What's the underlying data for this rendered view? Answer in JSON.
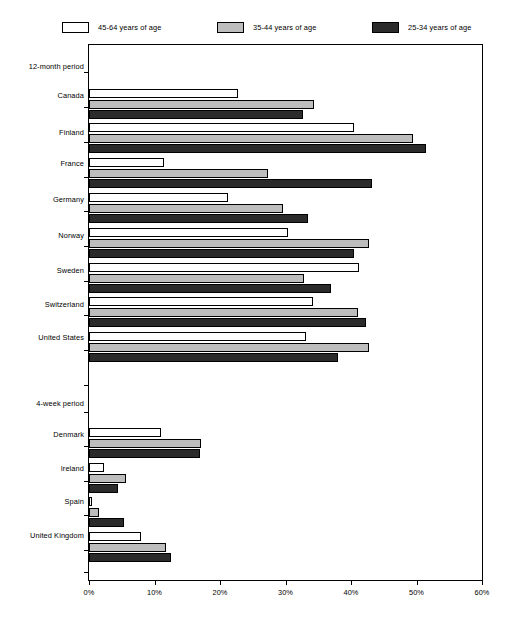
{
  "legend": {
    "items": [
      {
        "label": "45-64 years of age",
        "swatch": "white",
        "color": "#ffffff"
      },
      {
        "label": "35-44 years of age",
        "swatch": "gray",
        "color": "#bdbdbd"
      },
      {
        "label": "25-34 years of age",
        "swatch": "dark",
        "color": "#2b2b2b"
      }
    ]
  },
  "axis": {
    "ticks": [
      "0%",
      "10%",
      "20%",
      "30%",
      "40%",
      "50%",
      "60%"
    ],
    "min": 0,
    "max": 60
  },
  "sections": [
    {
      "label": "12-month period"
    },
    {
      "label": "4-week period"
    }
  ],
  "chart_data": {
    "type": "bar",
    "orientation": "horizontal",
    "title": "",
    "xlabel": "",
    "ylabel": "",
    "xlim": [
      0,
      60
    ],
    "xticks": [
      0,
      10,
      20,
      30,
      40,
      50,
      60
    ],
    "xtick_labels": [
      "0%",
      "10%",
      "20%",
      "30%",
      "40%",
      "50%",
      "60%"
    ],
    "grid": false,
    "legend_position": "top",
    "group_labels": [
      "12-month period",
      "4-week period"
    ],
    "groups": [
      {
        "name": "12-month period",
        "categories": [
          "Canada",
          "Finland",
          "France",
          "Germany",
          "Norway",
          "Sweden",
          "Switzerland",
          "United States"
        ]
      },
      {
        "name": "4-week period",
        "categories": [
          "Denmark",
          "Ireland",
          "Spain",
          "United Kingdom"
        ]
      }
    ],
    "categories": [
      "Canada",
      "Finland",
      "France",
      "Germany",
      "Norway",
      "Sweden",
      "Switzerland",
      "United States",
      "Denmark",
      "Ireland",
      "Spain",
      "United Kingdom"
    ],
    "series": [
      {
        "name": "45-64 years of age",
        "color": "#ffffff",
        "values": [
          22.7,
          40.5,
          11.4,
          21.2,
          30.4,
          41.2,
          34.2,
          33.1,
          11.0,
          2.3,
          0.5,
          7.9
        ]
      },
      {
        "name": "35-44 years of age",
        "color": "#bdbdbd",
        "values": [
          34.4,
          49.4,
          27.3,
          29.6,
          42.7,
          32.8,
          41.1,
          42.8,
          17.1,
          5.6,
          1.6,
          11.8
        ]
      },
      {
        "name": "25-34 years of age",
        "color": "#2b2b2b",
        "values": [
          32.7,
          51.5,
          43.2,
          33.4,
          40.5,
          36.9,
          42.3,
          38.0,
          16.9,
          4.4,
          5.4,
          12.5
        ]
      }
    ]
  }
}
